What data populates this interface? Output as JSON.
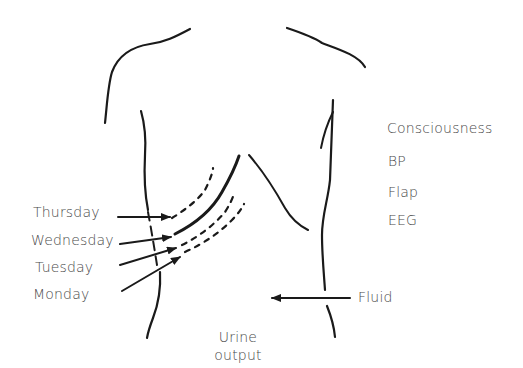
{
  "diagram": {
    "type": "anatomical-schematic",
    "day_labels": {
      "thursday": "Thursday",
      "wednesday": "Wednesday",
      "tuesday": "Tuesday",
      "monday": "Monday"
    },
    "monitoring_labels": {
      "consciousness": "Consciousness",
      "bp": "BP",
      "flap": "Flap",
      "eeg": "EEG"
    },
    "fluid_label": "Fluid",
    "urine_output": {
      "line1": "Urine",
      "line2": "output"
    },
    "colors": {
      "line": "#1a1a1a",
      "text": "#4a4a4a",
      "background": "#ffffff"
    }
  }
}
